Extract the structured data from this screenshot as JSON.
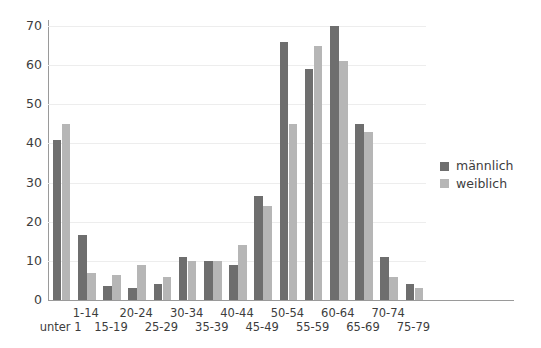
{
  "chart_data": {
    "type": "bar",
    "title": "",
    "subtitle": "",
    "xlabel": "",
    "ylabel": "",
    "ylim": [
      0,
      70
    ],
    "yticks": [
      0,
      10,
      20,
      30,
      40,
      50,
      60,
      70
    ],
    "grid": true,
    "legend_position": "right",
    "categories": [
      "unter 1",
      "1-14",
      "15-19",
      "20-24",
      "25-29",
      "30-34",
      "35-39",
      "40-44",
      "45-49",
      "50-54",
      "55-59",
      "60-64",
      "65-69",
      "70-74",
      "75-79"
    ],
    "series": [
      {
        "name": "männlich",
        "color": "#6e6e6e",
        "values": [
          41,
          16.5,
          3.5,
          3,
          4,
          11,
          10,
          9,
          26.5,
          66,
          59,
          70,
          45,
          11,
          4
        ]
      },
      {
        "name": "weiblich",
        "color": "#b6b6b6",
        "values": [
          45,
          7,
          6.5,
          9,
          6,
          10,
          10,
          14,
          24,
          45,
          65,
          61,
          43,
          6,
          3
        ]
      }
    ]
  },
  "legend": {
    "items": [
      {
        "label": "männlich",
        "color": "#6e6e6e"
      },
      {
        "label": "weiblich",
        "color": "#b6b6b6"
      }
    ]
  },
  "axes": {
    "y_tick_labels": [
      "70",
      "60",
      "50",
      "40",
      "30",
      "20",
      "10",
      "0"
    ],
    "x_tick_labels_upper": [
      "1-14",
      "20-24",
      "30-34",
      "40-44",
      "50-54",
      "60-64",
      "70-74"
    ],
    "x_tick_labels_lower": [
      "unter 1",
      "15-19",
      "25-29",
      "35-39",
      "45-49",
      "55-59",
      "65-69",
      "75-79"
    ]
  }
}
